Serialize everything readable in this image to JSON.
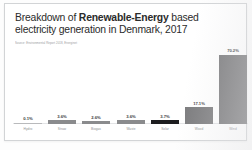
{
  "card": {
    "title_prefix": "Breakdown of ",
    "title_bold": "Renewable-Energy",
    "title_suffix": " based electricity generation in Denmark, 2017",
    "subtitle": "Source: Environmental Report 2018, Energinet"
  },
  "chart_data": {
    "type": "bar",
    "title": "Breakdown of Renewable-Energy based electricity generation in Denmark, 2017",
    "subtitle": "Source: Environmental Report 2018, Energinet",
    "xlabel": "",
    "ylabel": "",
    "ylim": [
      0,
      75
    ],
    "grid": false,
    "legend": "none",
    "value_suffix": "%",
    "categories": [
      "Hydro",
      "Straw",
      "Biogas",
      "Waste",
      "Solar",
      "Wood",
      "Wind"
    ],
    "values": [
      0.1,
      3.6,
      2.6,
      3.6,
      3.7,
      17.1,
      70.2
    ],
    "value_labels": [
      "0.1%",
      "3.6%",
      "2.6%",
      "3.6%",
      "3.7%",
      "17.1%",
      "70.2%"
    ],
    "bar_colors": [
      "#b9babc",
      "#8a8b8d",
      "#8a8b8d",
      "#8a8b8d",
      "#1d1d1f",
      "#7c7c7e",
      "#7c7c7e"
    ]
  },
  "colors": {
    "bar_default": "#7c7c7e",
    "bar_highlight": "#1d1d1f",
    "axis": "#e3e4e6",
    "text_primary": "#2b2b2b",
    "text_muted": "#8d8f92",
    "card_bg": "#ffffff",
    "card_border": "#d2d4d6"
  }
}
